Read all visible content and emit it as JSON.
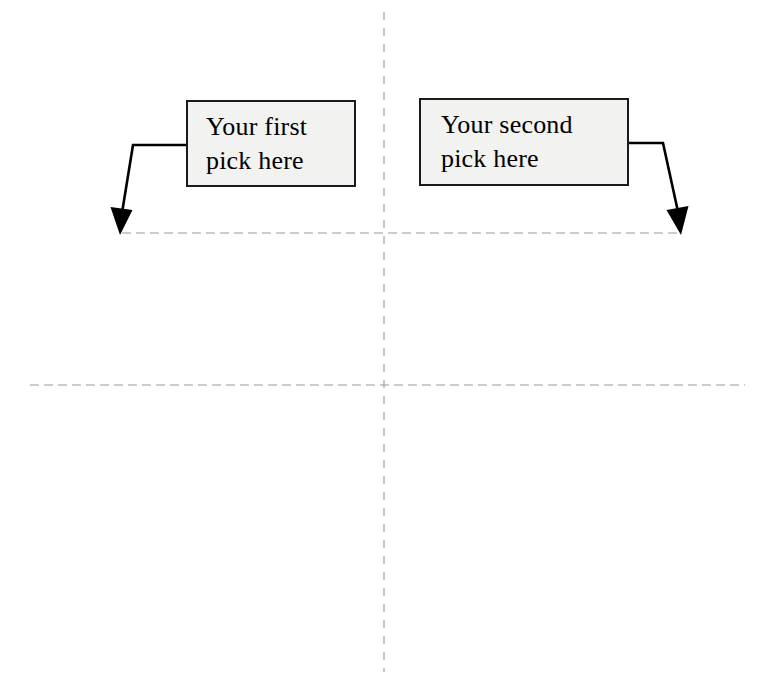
{
  "diagram": {
    "background_color": "#ffffff",
    "width": 764,
    "height": 688,
    "guides": {
      "dash_color": "#9a9a9a",
      "vertical_axis": {
        "name": "vertical-dashed-guide",
        "x": 384,
        "y_start": 12,
        "y_end": 672
      },
      "horizontal_axis": {
        "name": "horizontal-dashed-guide",
        "y": 385,
        "x_start": 30,
        "x_end": 745
      },
      "upper_guide": {
        "name": "upper-dashed-guide",
        "y": 233,
        "x_start": 122,
        "x_end": 679
      }
    },
    "callouts": [
      {
        "id": "first-pick",
        "label": "Your first\npick here",
        "line1": "Your first",
        "line2": "pick here",
        "fill_color": "#f2f2f0",
        "border_color": "#1a1a1a",
        "x": 186,
        "y": 100,
        "width": 170,
        "height": 87,
        "leader": {
          "name": "leader-line-first",
          "color": "#000000",
          "from_x": 186,
          "from_y": 145,
          "elbow_x": 133,
          "elbow_y": 145,
          "tip_x": 120,
          "tip_y": 233,
          "direction": "down-left"
        }
      },
      {
        "id": "second-pick",
        "label": "Your second\npick here",
        "line1": "Your second",
        "line2": "pick here",
        "fill_color": "#f2f2f0",
        "border_color": "#1a1a1a",
        "x": 419,
        "y": 98,
        "width": 210,
        "height": 88,
        "leader": {
          "name": "leader-line-second",
          "color": "#000000",
          "from_x": 629,
          "from_y": 143,
          "elbow_x": 663,
          "elbow_y": 143,
          "tip_x": 681,
          "tip_y": 233,
          "direction": "down-right"
        }
      }
    ]
  }
}
